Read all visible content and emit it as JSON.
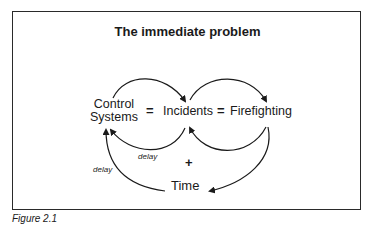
{
  "title": "The immediate problem",
  "nodes": {
    "control_systems": "Control\nSystems",
    "incidents": "Incidents",
    "firefighting": "Firefighting",
    "time": "Time"
  },
  "operators": {
    "eq1": "=",
    "eq2": "=",
    "plus": "+"
  },
  "labels": {
    "delay_inner": "delay",
    "delay_outer": "delay"
  },
  "edges": [
    {
      "from": "Control Systems",
      "to": "Incidents",
      "shape": "arc-top"
    },
    {
      "from": "Incidents",
      "to": "Firefighting",
      "shape": "arc-top"
    },
    {
      "from": "Incidents",
      "to": "Control Systems",
      "shape": "arc-bottom",
      "label": "delay"
    },
    {
      "from": "Firefighting",
      "to": "Incidents",
      "shape": "arc-bottom"
    },
    {
      "from": "Firefighting",
      "to": "Time",
      "shape": "arc-bottom"
    },
    {
      "from": "Time",
      "to": "Control Systems",
      "shape": "arc-left",
      "label": "delay"
    }
  ],
  "caption": "Figure 2.1"
}
